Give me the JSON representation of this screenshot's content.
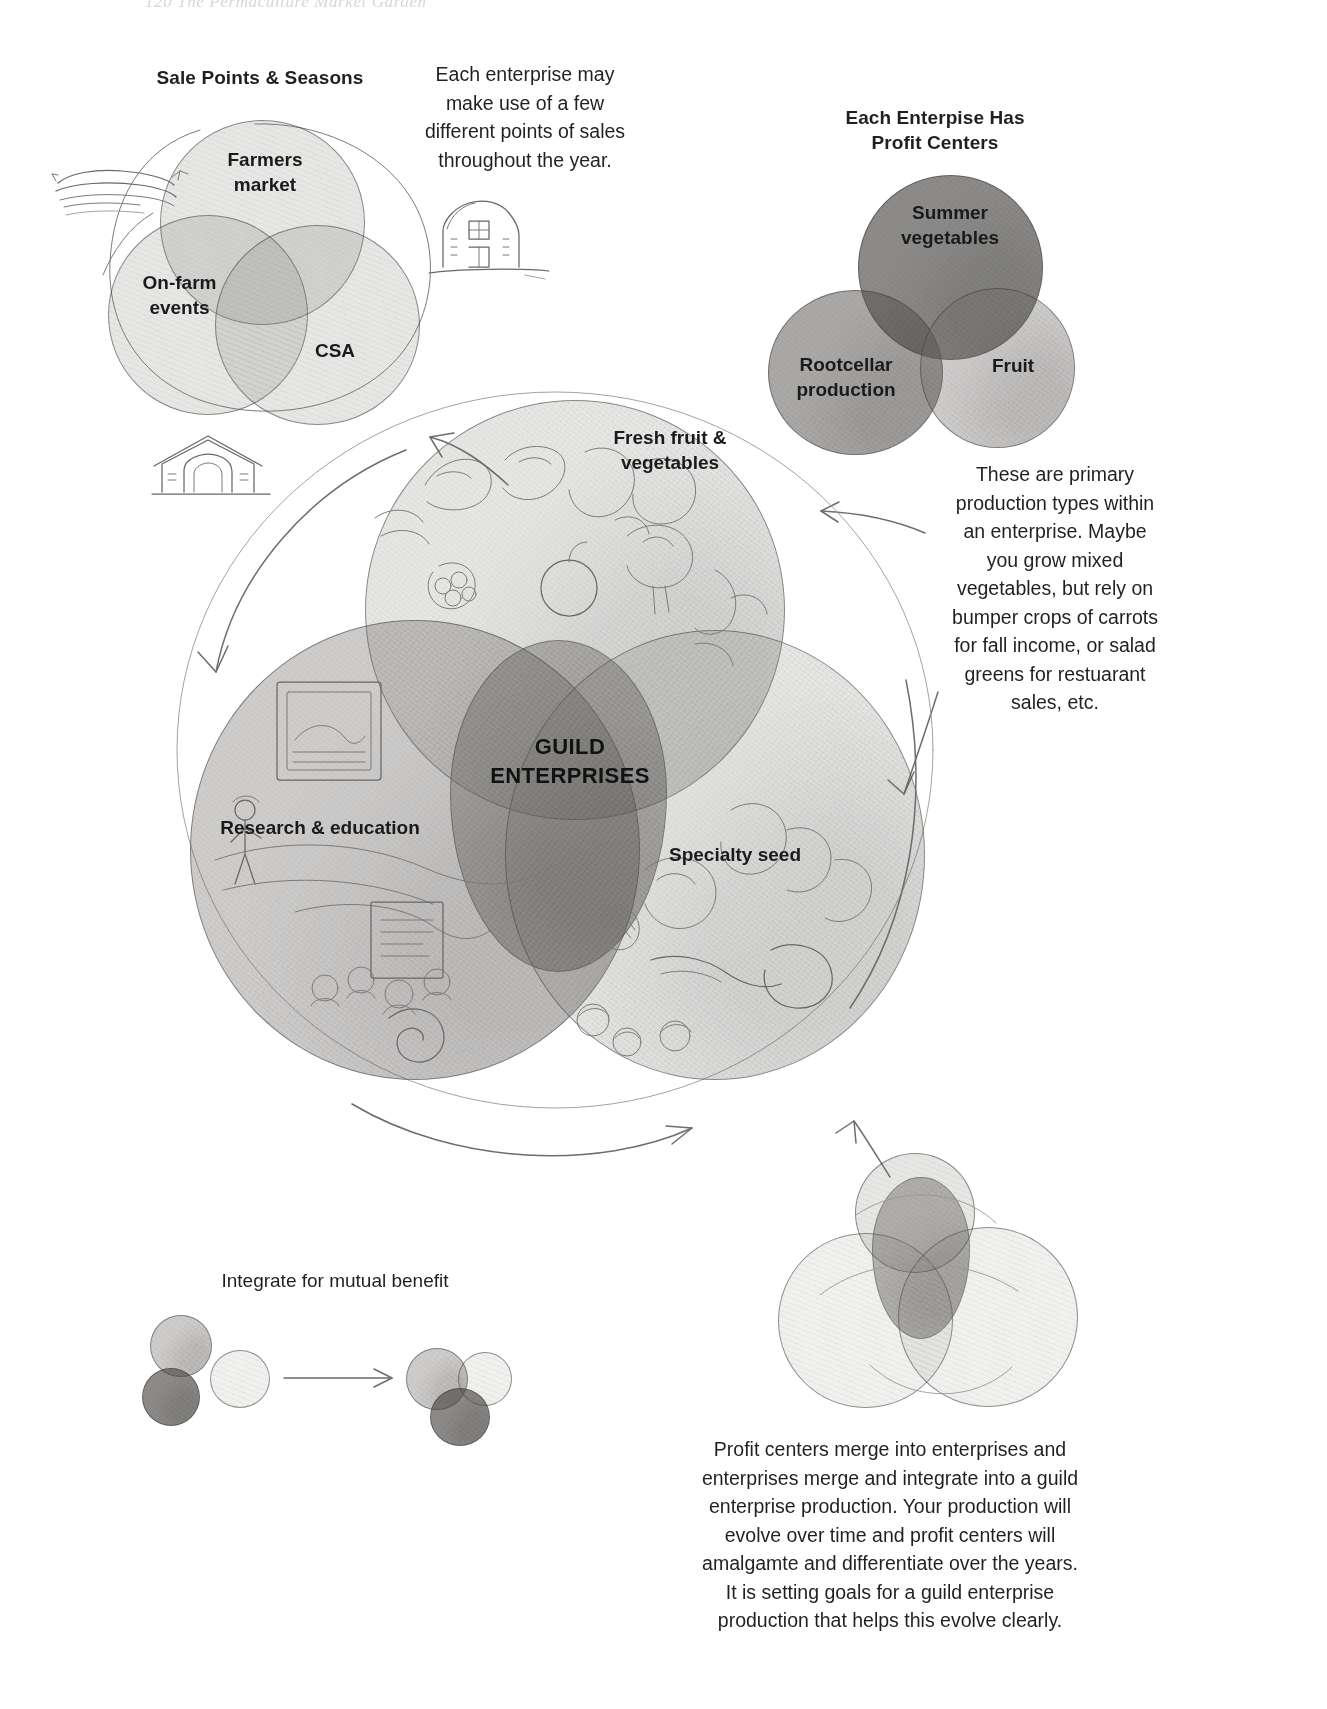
{
  "page": {
    "faint_header": "120    The Permaculture Market Garden"
  },
  "sale_points": {
    "heading": "Sale Points & Seasons",
    "circles": [
      {
        "label": "Farmers\nmarket",
        "line1": "Farmers",
        "line2": "market"
      },
      {
        "label": "On-farm\nevents",
        "line1": "On-farm",
        "line2": "events"
      },
      {
        "label": "CSA",
        "line1": "CSA",
        "line2": ""
      }
    ]
  },
  "note_top": {
    "lines": [
      "Each enterprise may",
      "make use of a few",
      "different points of sales",
      "throughout the year."
    ],
    "text": "Each enterprise may make use of a few different points of sales throughout the year."
  },
  "profit_centers": {
    "heading_line1": "Each Enterpise Has",
    "heading_line2": "Profit Centers",
    "circles": [
      {
        "line1": "Summer",
        "line2": "vegetables"
      },
      {
        "line1": "Rootcellar",
        "line2": "production"
      },
      {
        "line1": "Fruit",
        "line2": ""
      }
    ]
  },
  "note_right": {
    "lines": [
      "These are primary",
      "production types within",
      "an enterprise.  Maybe",
      "you grow mixed",
      "vegetables, but rely on",
      "bumper crops of carrots",
      "for fall income, or salad",
      "greens for restuarant",
      "sales, etc."
    ],
    "text": "These are primary production types within an enterprise. Maybe you grow mixed vegetables, but rely on bumper crops of carrots for fall income, or salad greens for restuarant sales, etc."
  },
  "guild": {
    "center_line1": "GUILD",
    "center_line2": "ENTERPRISES",
    "petals": [
      {
        "line1": "Fresh fruit &",
        "line2": "vegetables"
      },
      {
        "line1": "Research & education",
        "line2": ""
      },
      {
        "line1": "Specialty seed",
        "line2": ""
      }
    ]
  },
  "integrate": {
    "caption": "Integrate for mutual benefit"
  },
  "note_bottom": {
    "lines": [
      "Profit centers merge into enterprises and",
      "enterprises merge and integrate into a guild",
      "enterprise production. Your production will",
      "evolve over time and profit centers will",
      "amalgamte and differentiate over the years.",
      "It is setting goals for a guild enterprise",
      "production that helps this evolve clearly."
    ],
    "text": "Profit centers merge into enterprises and enterprises merge and integrate into a guild enterprise production. Your production will evolve over time and profit centers will amalgamte and differentiate over the years. It is setting goals for a guild enterprise production that helps this evolve clearly."
  },
  "icons": {
    "field_sketch": "field-row-sketch-icon",
    "barn": "barn-icon",
    "root_cellar": "root-cellar-icon",
    "arrow_cycle": "cycle-arrow-icon",
    "arrow_merge": "merge-arrow-icon",
    "arrow_pointer_nw": "pointer-arrow-nw-icon",
    "arrow_pointer_sw": "pointer-arrow-sw-icon"
  },
  "colors": {
    "ink": "#231f20",
    "pencil": "#6a6765",
    "paper": "#ffffff",
    "shade_light": "rgba(130,128,125,.20)",
    "shade_mid": "rgba(110,108,105,.34)",
    "shade_dark": "rgba(86,84,82,.50)"
  }
}
